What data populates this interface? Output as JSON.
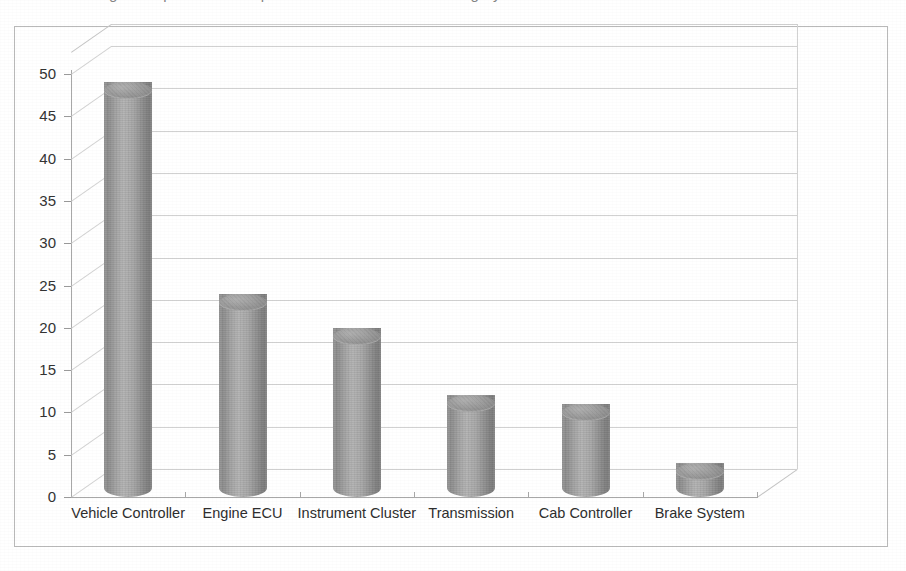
{
  "figure": {
    "frame_border_color": "#b9b9b9",
    "background": "#ffffff",
    "top_bleed_text": "Figure: reported issues per electronic control unit category"
  },
  "chart_data": {
    "type": "bar",
    "title": "",
    "subtitle": "",
    "xlabel": "",
    "ylabel": "",
    "categories": [
      "Vehicle Controller",
      "Engine ECU",
      "Instrument Cluster",
      "Transmission",
      "Cab Controller",
      "Brake System"
    ],
    "values": [
      48,
      23,
      19,
      11,
      10,
      3
    ],
    "ylim": [
      0,
      50
    ],
    "yticks": [
      0,
      5,
      10,
      15,
      20,
      25,
      30,
      35,
      40,
      45,
      50
    ],
    "ytick_labels": [
      "0",
      "5",
      "10",
      "15",
      "20",
      "25",
      "30",
      "35",
      "40",
      "45",
      "50"
    ],
    "grid": true,
    "grid_axis": "y",
    "legend": false,
    "legend_position": "none",
    "style": "3-D cylinder column chart",
    "bar_color": "#9e9e9e",
    "grid_color": "#cfcfcf",
    "axis_color": "#a8a8a8"
  }
}
